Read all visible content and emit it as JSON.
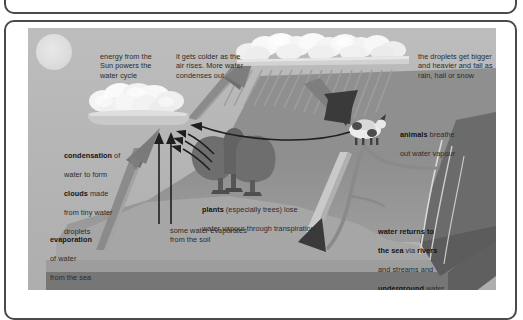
{
  "diagram": {
    "title": "the water cycle",
    "type": "water-cycle-cross-section",
    "colors": {
      "frame_stroke": "#4a4a4a",
      "sky": "#b9b9b9",
      "sun": "#e0e0e0",
      "cloud_fill": "#f2f2f2",
      "cloud_shadow": "#c8c8c8",
      "land_top": "#a5a5a5",
      "land_front": "#8f8f8f",
      "land_dark": "#6d6d6d",
      "sea": "#9a9a9a",
      "tree": "#6a6a6a",
      "arrow_big": "#8a8a8a",
      "arrow_dark": "#2e2e2e",
      "text": "#2b2b2b"
    },
    "labels": {
      "energy": {
        "text": "energy from the\nSun powers the\nwater cycle",
        "bold_terms": []
      },
      "colder": {
        "text": "it gets colder as the\nair rises. More water\ncondenses out",
        "bold_terms": []
      },
      "droplets": {
        "text": "the droplets get bigger\nand heavier and fall as\nrain, hail or snow",
        "bold_terms": []
      },
      "condensation": {
        "line1_bold": "condensation",
        "line1_rest": " of",
        "line2": "water to form",
        "line3_bold": "clouds",
        "line3_rest": " made",
        "line4": "from tiny water",
        "line5": "droplets"
      },
      "evaporation": {
        "line1_bold": "evaporation",
        "line2": "of water",
        "line3": "from the sea"
      },
      "soil": {
        "text": "some water evaporates\nfrom the soil"
      },
      "plants": {
        "line1_bold": "plants",
        "line1_rest": " (especially trees) lose",
        "line2": "water vapour through transpiration"
      },
      "animals": {
        "line1_bold": "animals",
        "line1_rest": " breathe",
        "line2": "out water vapour"
      },
      "returns": {
        "line1_bold": "water returns to",
        "line2_bold_a": "the sea",
        "line2_mid": " via ",
        "line2_bold_b": "rivers",
        "line3": "and streams and",
        "line4_bold": "underground",
        "line4_rest": " water"
      }
    },
    "elements": {
      "sun": "sun",
      "cloud_left": "cumulus-cloud",
      "cloud_rain": "rain-cloud",
      "rain": "rain-streaks",
      "trees": "trees",
      "animal": "cow",
      "river": "river",
      "sea": "sea",
      "arrow_evaporation": "evaporation-arrow",
      "arrow_rising_air": "rising-air-arrow",
      "arrow_rain": "rainfall-arrow",
      "arrow_runoff": "runoff-arrow",
      "arrows_soil": "soil-evaporation-arrows",
      "arrows_transpiration": "transpiration-arrows",
      "arrow_animal": "animal-vapour-arrow"
    }
  }
}
